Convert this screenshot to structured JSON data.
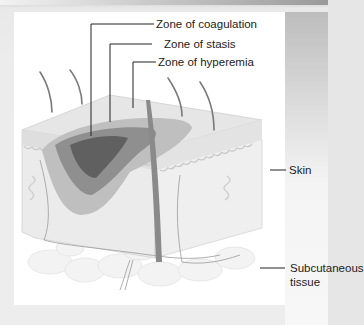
{
  "figure": {
    "labels": {
      "coagulation": "Zone of coagulation",
      "stasis": "Zone of stasis",
      "hyperemia": "Zone of hyperemia",
      "skin": "Skin",
      "subcutaneous_line1": "Subcutaneous",
      "subcutaneous_line2": "tissue"
    }
  },
  "colors": {
    "frame": "#e6e6e6",
    "panel": "#ffffff",
    "zone_coagulation": "#5e5e5e",
    "zone_stasis": "#8c8c8c",
    "zone_hyperemia": "#bdbdbd",
    "skin": "#e4e4e4",
    "leader_line": "#222222"
  }
}
